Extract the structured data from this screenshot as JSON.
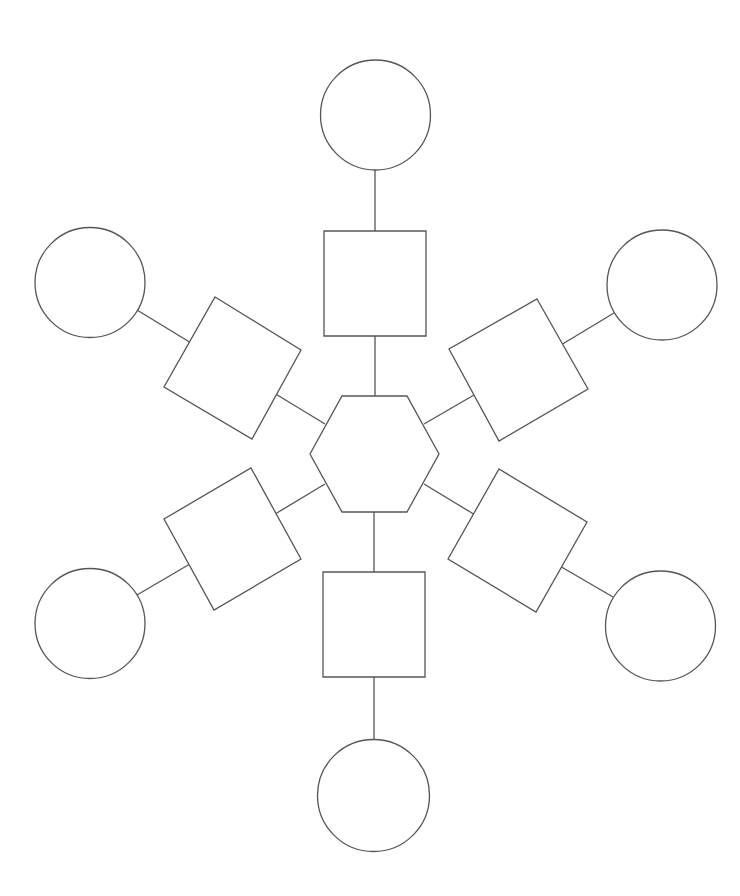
{
  "diagram": {
    "type": "snowflake-organizer",
    "stroke_color": "#555555",
    "fill_color": "#ffffff",
    "center": {
      "shape": "hexagon",
      "points": "342,396 407,396 439,454 407,512 342,512 310,454",
      "label": ""
    },
    "arms": [
      {
        "name": "top",
        "square": {
          "points": "324,231 426,231 426,336 324,336",
          "label": ""
        },
        "circle": {
          "cx": 375.5,
          "cy": 115,
          "r": 55,
          "label": ""
        },
        "connector_inner": {
          "x1": 375,
          "y1": 336,
          "x2": 375,
          "y2": 396
        },
        "connector_outer": {
          "x1": 375,
          "y1": 170,
          "x2": 375,
          "y2": 231
        }
      },
      {
        "name": "upper-right",
        "square": {
          "points": "537,299 588,389 499,441 449,349",
          "label": ""
        },
        "circle": {
          "cx": 662,
          "cy": 285,
          "r": 55,
          "label": ""
        },
        "connector_inner": {
          "x1": 474,
          "y1": 395,
          "x2": 424,
          "y2": 424
        },
        "connector_outer": {
          "x1": 562.5,
          "y1": 344,
          "x2": 614,
          "y2": 313
        }
      },
      {
        "name": "lower-right",
        "square": {
          "points": "499,469 587,522 536,612 448,559",
          "label": ""
        },
        "circle": {
          "cx": 660.5,
          "cy": 626,
          "r": 55,
          "label": ""
        },
        "connector_inner": {
          "x1": 473.5,
          "y1": 514,
          "x2": 424,
          "y2": 484
        },
        "connector_outer": {
          "x1": 561.5,
          "y1": 567,
          "x2": 613,
          "y2": 597
        }
      },
      {
        "name": "bottom",
        "square": {
          "points": "323,572 425,572 425,677 323,677",
          "label": ""
        },
        "circle": {
          "cx": 373.5,
          "cy": 795.5,
          "r": 56,
          "label": ""
        },
        "connector_inner": {
          "x1": 374,
          "y1": 512,
          "x2": 374,
          "y2": 572
        },
        "connector_outer": {
          "x1": 374,
          "y1": 677,
          "x2": 374,
          "y2": 740
        }
      },
      {
        "name": "lower-left",
        "square": {
          "points": "251,468 301,559 214,610 164,519",
          "label": ""
        },
        "circle": {
          "cx": 90,
          "cy": 623.5,
          "r": 55,
          "label": ""
        },
        "connector_inner": {
          "x1": 276,
          "y1": 513.5,
          "x2": 325,
          "y2": 484
        },
        "connector_outer": {
          "x1": 189,
          "y1": 564.5,
          "x2": 137,
          "y2": 595
        }
      },
      {
        "name": "upper-left",
        "square": {
          "points": "215,297 301,350 252,439 164,387",
          "label": ""
        },
        "circle": {
          "cx": 90,
          "cy": 282.5,
          "r": 55,
          "label": ""
        },
        "connector_inner": {
          "x1": 276.5,
          "y1": 394.5,
          "x2": 325,
          "y2": 424
        },
        "connector_outer": {
          "x1": 189.5,
          "y1": 342,
          "x2": 137,
          "y2": 310
        }
      }
    ]
  }
}
